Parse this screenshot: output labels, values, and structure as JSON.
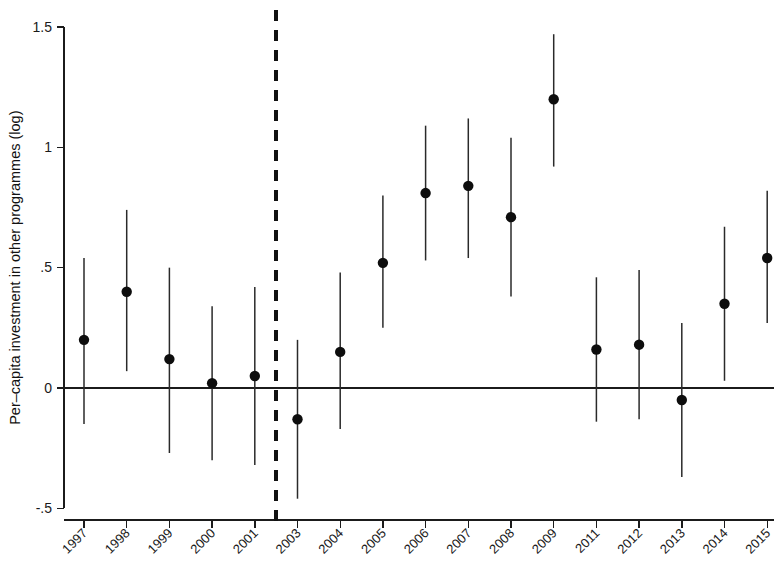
{
  "chart_data": {
    "type": "scatter",
    "title": "",
    "subtitle": "",
    "xlabel": "",
    "ylabel": "Per–capita investment in other programmes (log)",
    "ylim": [
      -0.5,
      1.5
    ],
    "yticks": [
      -0.5,
      0,
      0.5,
      1,
      1.5
    ],
    "ytick_labels": [
      "-.5",
      "0",
      ".5",
      "1",
      "1.5"
    ],
    "grid": false,
    "legend": null,
    "legend_position": "none",
    "categories": [
      "1997",
      "1998",
      "1999",
      "2000",
      "2001",
      "2003",
      "2004",
      "2005",
      "2006",
      "2007",
      "2008",
      "2009",
      "2011",
      "2012",
      "2013",
      "2014",
      "2015"
    ],
    "xtick_labels": [
      "1997",
      "1998",
      "1999",
      "2000",
      "2001",
      "2003",
      "2004",
      "2005",
      "2006",
      "2007",
      "2008",
      "2009",
      "2011",
      "2012",
      "2013",
      "2014",
      "2015"
    ],
    "values": [
      0.2,
      0.4,
      0.12,
      0.02,
      0.05,
      -0.13,
      0.15,
      0.52,
      0.81,
      0.84,
      0.71,
      1.2,
      0.16,
      0.18,
      -0.05,
      0.35,
      0.54
    ],
    "ci_low": [
      -0.15,
      0.07,
      -0.27,
      -0.3,
      -0.32,
      -0.46,
      -0.17,
      0.25,
      0.53,
      0.54,
      0.38,
      0.92,
      -0.14,
      -0.13,
      -0.37,
      0.03,
      0.27
    ],
    "ci_high": [
      0.54,
      0.74,
      0.5,
      0.34,
      0.42,
      0.2,
      0.48,
      0.8,
      1.09,
      1.12,
      1.04,
      1.47,
      0.46,
      0.49,
      0.27,
      0.67,
      0.82
    ],
    "series": [
      {
        "name": "Point estimate with 95% confidence interval",
        "values": [
          0.2,
          0.4,
          0.12,
          0.02,
          0.05,
          -0.13,
          0.15,
          0.52,
          0.81,
          0.84,
          0.71,
          1.2,
          0.16,
          0.18,
          -0.05,
          0.35,
          0.54
        ]
      }
    ],
    "annotations": [
      {
        "kind": "vertical-dashed-reference-line",
        "label": "",
        "between_categories": [
          "2001",
          "2003"
        ]
      },
      {
        "kind": "horizontal-zero-line",
        "label": "",
        "y": 0
      }
    ],
    "colors": {
      "marker": "#0d0d0d",
      "interval": "#2a2a2a",
      "axis": "#1b1b1b",
      "reference_line": "#111111",
      "background": "#ffffff"
    }
  }
}
